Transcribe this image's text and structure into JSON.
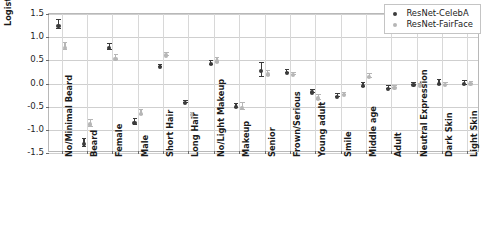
{
  "chart_data": {
    "type": "scatter",
    "title": "",
    "xlabel": "",
    "ylabel": "Logistic Regression Coefficient",
    "ylim": [
      -1.5,
      1.5
    ],
    "yticks": [
      "1.5",
      "1.0",
      "0.5",
      "0.0",
      "-0.5",
      "-1.0",
      "-1.5"
    ],
    "ytick_values": [
      1.5,
      1.0,
      0.5,
      0.0,
      -0.5,
      -1.0,
      -1.5
    ],
    "grid": true,
    "legend_position": "upper right",
    "error_bars": true,
    "categories": [
      "No/Minimal Beard",
      "Beard",
      "Female",
      "Male",
      "Short Hair",
      "Long Hair",
      "No/Light Makeup",
      "Makeup",
      "Senior",
      "Frown/Serious",
      "Young adult",
      "Smile",
      "Middle age",
      "Adult",
      "Neutral Expression",
      "Dark Skin",
      "Light Skin"
    ],
    "series": [
      {
        "name": "ResNet-CelebA",
        "color": "#3b3b3b",
        "values": [
          1.29,
          -1.26,
          0.81,
          -0.81,
          0.4,
          -0.38,
          0.47,
          -0.46,
          0.32,
          0.28,
          -0.15,
          -0.24,
          -0.01,
          -0.07,
          0.01,
          0.04,
          0.03
        ],
        "errors": [
          0.1,
          0.09,
          0.07,
          0.07,
          0.02,
          0.02,
          0.04,
          0.04,
          0.15,
          0.03,
          0.04,
          0.03,
          0.05,
          0.03,
          0.02,
          0.05,
          0.04
        ]
      },
      {
        "name": "ResNet-FairFace",
        "color": "#b6b6b6",
        "values": [
          0.82,
          -0.84,
          0.58,
          -0.61,
          0.65,
          -0.63,
          0.52,
          -0.48,
          0.24,
          0.23,
          -0.28,
          -0.2,
          0.18,
          -0.06,
          0.0,
          0.01,
          0.04
        ],
        "errors": [
          0.07,
          0.08,
          0.06,
          0.05,
          0.03,
          0.02,
          0.06,
          0.07,
          0.05,
          0.02,
          0.06,
          0.02,
          0.05,
          0.02,
          0.02,
          0.02,
          0.02
        ]
      }
    ]
  },
  "legend": {
    "items": [
      {
        "label": "ResNet-CelebA",
        "color": "#3b3b3b"
      },
      {
        "label": "ResNet-FairFace",
        "color": "#b6b6b6"
      }
    ]
  }
}
